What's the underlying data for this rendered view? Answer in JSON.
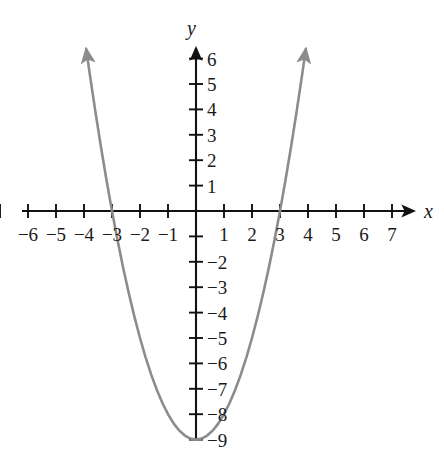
{
  "chart_data": {
    "type": "line",
    "title": "",
    "subtitle": "",
    "xlabel": "x",
    "ylabel": "y",
    "equation": "y = x^2 - 9",
    "grid": false,
    "legend": null,
    "xlim": [
      -7.6,
      7.8
    ],
    "ylim": [
      -9.9,
      6.9
    ],
    "x_ticks": [
      -7,
      -6,
      -5,
      -4,
      -3,
      -2,
      -1,
      0,
      1,
      2,
      3,
      4,
      5,
      6,
      7
    ],
    "y_ticks": [
      -9,
      -8,
      -7,
      -6,
      -5,
      -4,
      -3,
      -2,
      -1,
      1,
      2,
      3,
      4,
      5,
      6
    ],
    "x_tick_labels": [
      {
        "value": -6,
        "label": "−6"
      },
      {
        "value": -5,
        "label": "−5"
      },
      {
        "value": -4,
        "label": "−4"
      },
      {
        "value": -3,
        "label": "−3"
      },
      {
        "value": -2,
        "label": "−2"
      },
      {
        "value": -1,
        "label": "−1"
      },
      {
        "value": 1,
        "label": "1"
      },
      {
        "value": 2,
        "label": "2"
      },
      {
        "value": 3,
        "label": "3"
      },
      {
        "value": 4,
        "label": "4"
      },
      {
        "value": 5,
        "label": "5"
      },
      {
        "value": 6,
        "label": "6"
      },
      {
        "value": 7,
        "label": "7"
      }
    ],
    "y_tick_labels": [
      {
        "value": 6,
        "label": "6"
      },
      {
        "value": 5,
        "label": "5"
      },
      {
        "value": 4,
        "label": "4"
      },
      {
        "value": 3,
        "label": "3"
      },
      {
        "value": 2,
        "label": "2"
      },
      {
        "value": 1,
        "label": "1"
      },
      {
        "value": -2,
        "label": "−2"
      },
      {
        "value": -3,
        "label": "−3"
      },
      {
        "value": -4,
        "label": "−4"
      },
      {
        "value": -5,
        "label": "−5"
      },
      {
        "value": -6,
        "label": "−6"
      },
      {
        "value": -7,
        "label": "−7"
      },
      {
        "value": -8,
        "label": "−8"
      },
      {
        "value": -9,
        "label": "−9"
      }
    ],
    "series": [
      {
        "name": "y = x^2 - 9",
        "color": "#8c8c8c",
        "arrow_start": true,
        "arrow_end": true,
        "vertex": [
          0,
          -9
        ],
        "roots": [
          -3,
          3
        ],
        "y_intercept": -9,
        "points": [
          [
            -3.92,
            6.37
          ],
          [
            -3.8,
            5.44
          ],
          [
            -3.6,
            3.96
          ],
          [
            -3.4,
            2.56
          ],
          [
            -3.2,
            1.24
          ],
          [
            -3.0,
            0.0
          ],
          [
            -2.8,
            -1.16
          ],
          [
            -2.6,
            -2.24
          ],
          [
            -2.4,
            -3.24
          ],
          [
            -2.2,
            -4.16
          ],
          [
            -2.0,
            -5.0
          ],
          [
            -1.8,
            -5.76
          ],
          [
            -1.6,
            -6.44
          ],
          [
            -1.4,
            -7.04
          ],
          [
            -1.2,
            -7.56
          ],
          [
            -1.0,
            -8.0
          ],
          [
            -0.8,
            -8.36
          ],
          [
            -0.6,
            -8.64
          ],
          [
            -0.4,
            -8.84
          ],
          [
            -0.2,
            -8.96
          ],
          [
            0.0,
            -9.0
          ],
          [
            0.2,
            -8.96
          ],
          [
            0.4,
            -8.84
          ],
          [
            0.6,
            -8.64
          ],
          [
            0.8,
            -8.36
          ],
          [
            1.0,
            -8.0
          ],
          [
            1.2,
            -7.56
          ],
          [
            1.4,
            -7.04
          ],
          [
            1.6,
            -6.44
          ],
          [
            1.8,
            -5.76
          ],
          [
            2.0,
            -5.0
          ],
          [
            2.2,
            -4.16
          ],
          [
            2.4,
            -3.24
          ],
          [
            2.6,
            -2.24
          ],
          [
            2.8,
            -1.16
          ],
          [
            3.0,
            0.0
          ],
          [
            3.2,
            1.24
          ],
          [
            3.4,
            2.56
          ],
          [
            3.6,
            3.96
          ],
          [
            3.8,
            5.44
          ],
          [
            3.92,
            6.37
          ]
        ]
      }
    ],
    "axis_color": "#111111",
    "curve_color": "#8c8c8c"
  },
  "axes": {
    "x_axis_label": "x",
    "y_axis_label": "y"
  }
}
